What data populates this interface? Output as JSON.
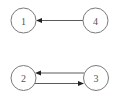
{
  "diagram": {
    "type": "directed-graph",
    "nodes": [
      {
        "id": "1",
        "label": "1",
        "cx": 23.5,
        "cy": 20.5,
        "r": 12.5
      },
      {
        "id": "4",
        "label": "4",
        "cx": 95.5,
        "cy": 20.5,
        "r": 12.5
      },
      {
        "id": "2",
        "label": "2",
        "cx": 23.5,
        "cy": 78,
        "r": 12.5
      },
      {
        "id": "3",
        "label": "3",
        "cx": 96,
        "cy": 78,
        "r": 12.5
      }
    ],
    "edges": [
      {
        "from": "4",
        "to": "1"
      },
      {
        "from": "3",
        "to": "2"
      },
      {
        "from": "2",
        "to": "3"
      }
    ],
    "colors": {
      "node_stroke": "#7a7a7a",
      "label": "#555555",
      "edge": "#5a5a5a",
      "arrowhead": "#222222",
      "background": "#ffffff"
    }
  }
}
